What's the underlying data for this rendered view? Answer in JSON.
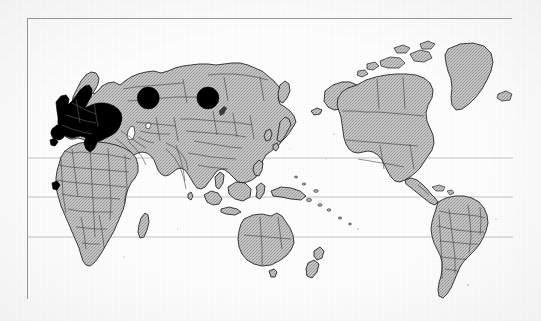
{
  "figure": {
    "title": "World map with highlighted regions",
    "caption": "",
    "projection": "Pacific-centred equirectangular world map",
    "background_color": "#ffffff",
    "frame_color": "#9a9a9a",
    "land_fill_color": "#b9b9b9",
    "land_outline_color": "#1a1a1a",
    "highlight_fill_color": "#000000",
    "graticule_color": "#bdbdbd"
  },
  "map_data": {
    "type": "choropleth",
    "style": "scanned halftone grayscale print",
    "center_longitude": 150,
    "lon_range": [
      -30,
      330
    ],
    "lat_range": [
      -60,
      84
    ],
    "graticule": {
      "parallels": [
        {
          "name": "Tropic of Cancer",
          "latitude": 23.5,
          "label": ""
        },
        {
          "name": "Equator",
          "latitude": 0,
          "label": ""
        },
        {
          "name": "Tropic of Capricorn",
          "latitude": -23.5,
          "label": ""
        }
      ],
      "meridians": [],
      "labels_visible": false
    },
    "legend": {
      "visible": false,
      "entries": []
    },
    "regions": [
      {
        "name": "Western and Central Europe",
        "fill": "highlight",
        "color": "#000000"
      },
      {
        "name": "Asia",
        "fill": "land",
        "color": "#b9b9b9"
      },
      {
        "name": "Africa",
        "fill": "land",
        "color": "#b9b9b9"
      },
      {
        "name": "North America",
        "fill": "land",
        "color": "#b9b9b9"
      },
      {
        "name": "South America",
        "fill": "land",
        "color": "#b9b9b9"
      },
      {
        "name": "Greenland",
        "fill": "land",
        "color": "#b9b9b9"
      },
      {
        "name": "Australia",
        "fill": "land",
        "color": "#b9b9b9"
      },
      {
        "name": "New Zealand",
        "fill": "land",
        "color": "#b9b9b9"
      },
      {
        "name": "Japan",
        "fill": "land",
        "color": "#b9b9b9"
      },
      {
        "name": "Indonesia and Philippines",
        "fill": "land",
        "color": "#b9b9b9"
      }
    ],
    "markers": [
      {
        "id": "marker-1",
        "shape": "circle",
        "color": "#000000",
        "label": "",
        "approx_location": "Central Asia / south-central Siberia",
        "x_pct": 24.8,
        "y_pct": 28.1,
        "radius_px": 11
      },
      {
        "id": "marker-2",
        "shape": "circle",
        "color": "#000000",
        "label": "",
        "approx_location": "Mongolia / north-east Asia",
        "x_pct": 37.1,
        "y_pct": 28.1,
        "radius_px": 11
      }
    ],
    "annotations": [],
    "axis_labels": {
      "x": "",
      "y": ""
    }
  }
}
